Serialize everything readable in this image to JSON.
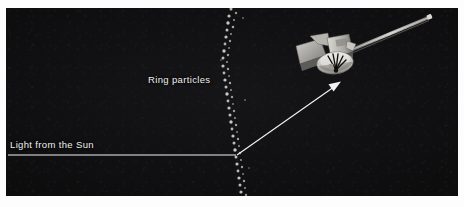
{
  "figure": {
    "kind": "astronomy-diagram",
    "width": 464,
    "height": 207,
    "background_color": "#ffffff",
    "panel_color": "#0b0b0c",
    "ink_color": "#f2f2f2"
  },
  "labels": {
    "ring_particles": "Ring particles",
    "light_from_sun": "Light from the Sun"
  },
  "annotations": {
    "sun_ray": {
      "name": "Light from the Sun",
      "type": "straight-ray",
      "from": [
        8,
        155
      ],
      "to": [
        236,
        155
      ],
      "color": "#f2f2f2"
    },
    "scattered_ray": {
      "name": "Scattered light toward spacecraft",
      "type": "arrow",
      "from": [
        237,
        155
      ],
      "to": [
        341,
        82
      ],
      "color": "#f2f2f2",
      "arrowhead": "end"
    },
    "scattering_point": [
      237,
      155
    ]
  },
  "ring_particles": {
    "name": "Ring particles",
    "appearance": "wavy vertical band of small bright grains",
    "color": "#d8d6d0",
    "band_x_center": 233,
    "band_top": 8,
    "band_bottom": 196,
    "count": 58
  },
  "spacecraft": {
    "name": "Spacecraft",
    "color_body": "#b9b7b2",
    "color_shadow": "#6e6c69",
    "color_boom": "#8e8c88",
    "parts": [
      "high-gain-dish-antenna",
      "instrument-bus",
      "solar-panel-wing",
      "magnetometer-boom",
      "thruster-cluster"
    ],
    "position": [
      296,
      14
    ],
    "size": [
      134,
      74
    ]
  },
  "colors": {
    "panel": "#0b0b0c",
    "page": "#ffffff",
    "ink": "#f2f2f2",
    "particle": "#d8d6d0",
    "spacecraft": "#b9b7b2"
  }
}
